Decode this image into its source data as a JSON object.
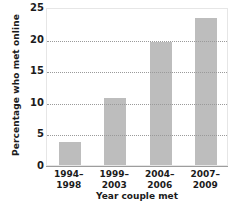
{
  "chart_data": {
    "type": "bar",
    "title": "",
    "xlabel": "Year couple met",
    "ylabel": "Percentage who met online",
    "categories": [
      "1994–1998",
      "1999–2003",
      "2004–2006",
      "2007–2009"
    ],
    "category_lines": [
      {
        "line1": "1994–",
        "line2": "1998"
      },
      {
        "line1": "1999–",
        "line2": "2003"
      },
      {
        "line1": "2004–",
        "line2": "2006"
      },
      {
        "line1": "2007–",
        "line2": "2009"
      }
    ],
    "values": [
      3.7,
      10.6,
      19.4,
      23.3
    ],
    "ylim": [
      0,
      25
    ],
    "ytick_labels": [
      "0",
      "5",
      "10",
      "15",
      "20",
      "25"
    ],
    "ytick_values": [
      0,
      5,
      10,
      15,
      20,
      25
    ],
    "gridline_values": [
      5,
      10,
      15,
      20
    ],
    "grid": "horizontal-dotted",
    "legend": "none",
    "bar_color": "#bdbdbd",
    "grid_color": "#9a9a9a",
    "axis_color": "#9d9d9d",
    "text_color": "#1b1b1b",
    "background_color": "#ffffff"
  }
}
